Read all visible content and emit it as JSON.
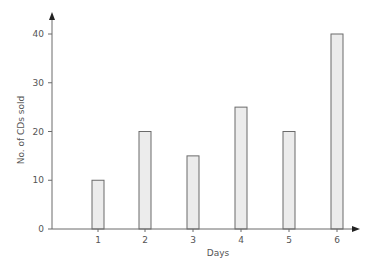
{
  "chart_data": {
    "type": "bar",
    "title": "",
    "xlabel": "Days",
    "ylabel": "No. of CDs sold",
    "categories": [
      "1",
      "2",
      "3",
      "4",
      "5",
      "6"
    ],
    "values": [
      10,
      20,
      15,
      25,
      20,
      40
    ],
    "ylim": [
      0,
      40
    ],
    "yticks": [
      0,
      10,
      20,
      30,
      40
    ],
    "grid": false,
    "legend": null,
    "colors": {
      "bar_fill": "#ececec",
      "bar_stroke": "#6b6b6b",
      "axis": "#6b6b6b",
      "text": "#555555"
    }
  }
}
